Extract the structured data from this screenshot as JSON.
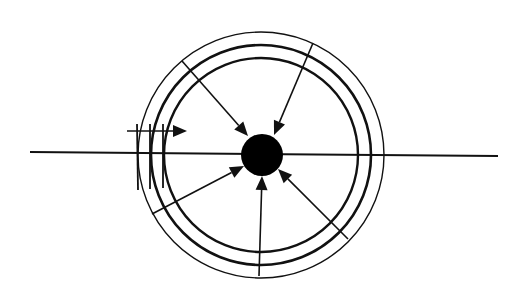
{
  "diagram": {
    "width": 522,
    "height": 305,
    "background": "#ffffff",
    "stroke": "#111111",
    "center": {
      "x": 261,
      "y": 155
    },
    "rings": [
      {
        "name": "outer-ring",
        "r": 123,
        "width": 1.4
      },
      {
        "name": "middle-ring",
        "r": 110,
        "width": 2.6
      },
      {
        "name": "inner-ring",
        "r": 97,
        "width": 2.4
      }
    ],
    "core": {
      "cx": 262,
      "cy": 155,
      "r": 21,
      "fill": "#000000"
    },
    "axis_line": {
      "x1": 30,
      "y1": 152,
      "x2": 498,
      "y2": 156,
      "width": 2
    },
    "inward_arrows": [
      {
        "name": "arrow-upper-left",
        "x1": 182,
        "y1": 61,
        "x2": 248,
        "y2": 136
      },
      {
        "name": "arrow-upper-right",
        "x1": 313,
        "y1": 43,
        "x2": 274,
        "y2": 135
      },
      {
        "name": "arrow-lower-left",
        "x1": 152,
        "y1": 214,
        "x2": 244,
        "y2": 166
      },
      {
        "name": "arrow-bottom",
        "x1": 259,
        "y1": 276,
        "x2": 262,
        "y2": 176
      },
      {
        "name": "arrow-lower-right",
        "x1": 348,
        "y1": 239,
        "x2": 278,
        "y2": 169
      }
    ],
    "side_arrow": {
      "x1": 127,
      "y1": 131,
      "x2": 187,
      "y2": 131
    },
    "tick_marks": [
      {
        "x": 137,
        "y1": 124,
        "y2": 190
      },
      {
        "x": 150,
        "y1": 124,
        "y2": 189
      },
      {
        "x": 163,
        "y1": 124,
        "y2": 188
      }
    ]
  }
}
